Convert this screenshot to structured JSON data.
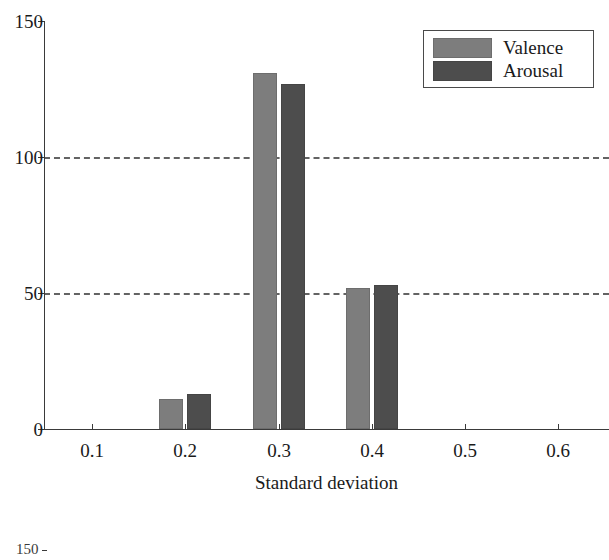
{
  "chart_data": {
    "type": "bar",
    "title": "",
    "xlabel": "Standard deviation",
    "ylabel": "",
    "categories": [
      "0.1",
      "0.2",
      "0.3",
      "0.4",
      "0.5",
      "0.6"
    ],
    "x": [
      0.1,
      0.2,
      0.3,
      0.4,
      0.5,
      0.6
    ],
    "series": [
      {
        "name": "Valence",
        "color": "#7d7d7d",
        "values": [
          0,
          11,
          131,
          52,
          0,
          0
        ]
      },
      {
        "name": "Arousal",
        "color": "#4d4d4d",
        "values": [
          0,
          13,
          127,
          53,
          0,
          0
        ]
      }
    ],
    "ylim": [
      0,
      150
    ],
    "xlim": [
      0.05,
      0.65
    ],
    "yticks": [
      0,
      50,
      100,
      150
    ],
    "ytick_labels": [
      "0",
      "50",
      "100",
      "150"
    ],
    "xticks": [
      0.1,
      0.2,
      0.3,
      0.4,
      0.5,
      0.6
    ],
    "xtick_labels": [
      "0.1",
      "0.2",
      "0.3",
      "0.4",
      "0.5",
      "0.6"
    ],
    "gridlines": {
      "y": [
        50,
        100
      ],
      "style": "dashed",
      "color": "#636363"
    },
    "legend": {
      "position": "top-right",
      "entries": [
        {
          "label": "Valence",
          "color": "#7d7d7d"
        },
        {
          "label": "Arousal",
          "color": "#4d4d4d"
        }
      ]
    }
  },
  "axis": {
    "y_labels": [
      "150",
      "100",
      "50",
      "0"
    ],
    "x_labels": [
      "0.1",
      "0.2",
      "0.3",
      "0.4",
      "0.5",
      "0.6"
    ],
    "x_title": "Standard deviation"
  },
  "legend": {
    "valence_label": "Valence",
    "arousal_label": "Arousal"
  },
  "artifact": {
    "next_figure_label": "150"
  }
}
